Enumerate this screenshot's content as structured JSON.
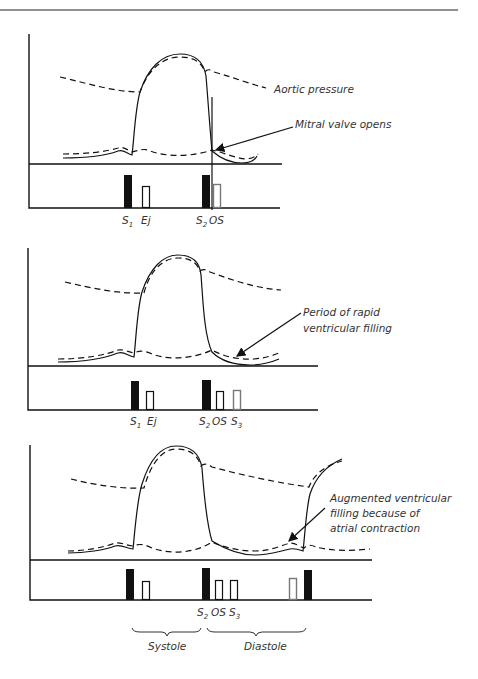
{
  "figure": {
    "panels": [
      {
        "id": "panel-1",
        "annotations": [
          "Aortic pressure",
          "Mitral valve opens"
        ],
        "sound_labels": [
          "S1",
          "Ej",
          "S2",
          "OS"
        ]
      },
      {
        "id": "panel-2",
        "annotations": [
          "Period of rapid",
          "ventricular filling"
        ],
        "sound_labels": [
          "S1",
          "Ej",
          "S2",
          "OS",
          "S3"
        ]
      },
      {
        "id": "panel-3",
        "annotations": [
          "Augmented ventricular",
          "filling because of",
          "atrial contraction"
        ],
        "sound_labels": [
          "S2",
          "OS",
          "S3"
        ],
        "phases": [
          "Systole",
          "Diastole"
        ]
      }
    ]
  },
  "labels": {
    "aortic_pressure": "Aortic pressure",
    "mitral_valve_opens": "Mitral valve opens",
    "rapid_filling_1": "Period of rapid",
    "rapid_filling_2": "ventricular filling",
    "augmented_1": "Augmented ventricular",
    "augmented_2": "filling because of",
    "augmented_3": "atrial contraction",
    "S": "S",
    "sub1": "1",
    "sub2": "2",
    "sub3": "3",
    "Ej": "Ej",
    "OS": "OS",
    "systole": "Systole",
    "diastole": "Diastole"
  }
}
